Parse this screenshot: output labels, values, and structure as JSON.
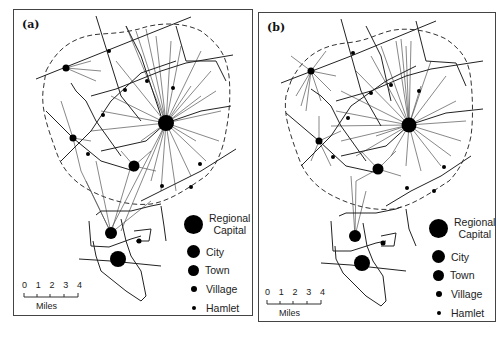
{
  "figure": {
    "panels": [
      {
        "id": "a",
        "label": "(a)"
      },
      {
        "id": "b",
        "label": "(b)"
      }
    ],
    "legend": {
      "items": [
        {
          "label": "Regional Capital",
          "line1": "Regional",
          "line2": "Capital",
          "size": 18
        },
        {
          "label": "City",
          "size": 13
        },
        {
          "label": "Town",
          "size": 11
        },
        {
          "label": "Village",
          "size": 6
        },
        {
          "label": "Hamlet",
          "size": 4
        }
      ]
    },
    "scale_bar": {
      "ticks": [
        "0",
        "1",
        "2",
        "3",
        "4"
      ],
      "unit": "Miles"
    },
    "colors": {
      "settlement": "#000000",
      "road": "#222222",
      "service_line": "#555555",
      "boundary": "#333333"
    }
  }
}
